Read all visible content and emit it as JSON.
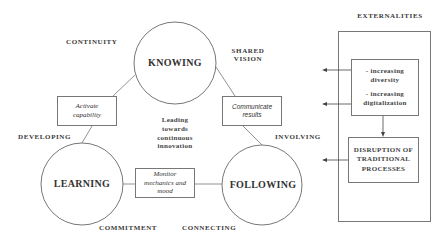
{
  "diagram": {
    "nodes": {
      "knowing": {
        "label": "KNOWING"
      },
      "learning": {
        "label": "LEARNING"
      },
      "following": {
        "label": "FOLLOWING"
      }
    },
    "connectors": {
      "activate": {
        "line1": "Activate",
        "line2": "capability"
      },
      "communicate": {
        "line1": "Communicate",
        "line2": "results"
      },
      "monitor": {
        "line1": "Monitor",
        "line2": "mechanics and",
        "line3": "mood"
      }
    },
    "center_text": {
      "line1": "Leading",
      "line2": "towards",
      "line3": "continuous",
      "line4": "innovation"
    },
    "edge_labels": {
      "continuity": "CONTINUITY",
      "shared_vision_1": "SHARED",
      "shared_vision_2": "VISION",
      "developing": "DEVELOPING",
      "involving": "INVOLVING",
      "commitment": "COMMITMENT",
      "connecting": "CONNECTING"
    },
    "externalities": {
      "title": "EXTERNALITIES",
      "items": [
        {
          "line1": "- increasing",
          "line2": "diversity"
        },
        {
          "line1": "- increasing",
          "line2": "digitalization"
        }
      ],
      "disruption": {
        "line1": "DISRUPTION OF",
        "line2": "TRADITIONAL",
        "line3": "PROCESSES"
      }
    },
    "colors": {
      "stroke": "#777777",
      "text": "#333333",
      "background": "#ffffff"
    }
  }
}
